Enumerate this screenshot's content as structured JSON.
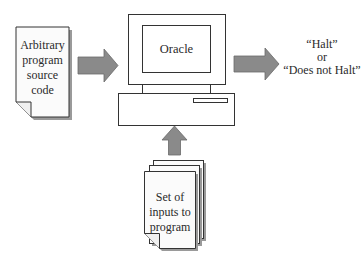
{
  "diagram": {
    "source_doc": {
      "lines": [
        "Arbitrary",
        "program",
        "source",
        "code"
      ]
    },
    "oracle": {
      "label": "Oracle"
    },
    "inputs_doc": {
      "lines": [
        "Set of",
        "inputs to",
        "program"
      ]
    },
    "output": {
      "lines": [
        "“Halt”",
        "or",
        "“Does not Halt”"
      ]
    },
    "colors": {
      "arrow_fill": "#8a8a8a",
      "arrow_stroke": "#6a6a6a",
      "outline": "#333333",
      "shadow": "#9a9a9a",
      "paper": "#fbfbfb"
    }
  }
}
